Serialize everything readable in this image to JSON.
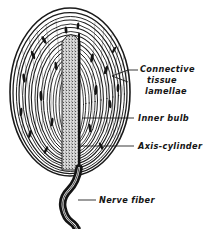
{
  "figure": {
    "background_color": "#ffffff",
    "ink_color": "#151515",
    "labels": [
      {
        "id": "connective-tissue-lamellae",
        "lines": [
          "Connective",
          "tissue",
          "lamellae"
        ],
        "x": 140,
        "y": 72,
        "leader": "forked"
      },
      {
        "id": "inner-bulb",
        "lines": [
          "Inner bulb"
        ],
        "x": 136,
        "y": 120,
        "leader": "straight"
      },
      {
        "id": "axis-cylinder",
        "lines": [
          "Axis-cylinder"
        ],
        "x": 136,
        "y": 148,
        "leader": "straight"
      },
      {
        "id": "nerve-fiber",
        "lines": [
          "Nerve fiber"
        ],
        "x": 98,
        "y": 203,
        "leader": "straight"
      }
    ],
    "structures": {
      "capsule": "concentric connective tissue lamellae",
      "inner_bulb": "stippled central core",
      "axis_cylinder": "dark central line",
      "nerve_fiber": "wavy stalk at base"
    }
  }
}
